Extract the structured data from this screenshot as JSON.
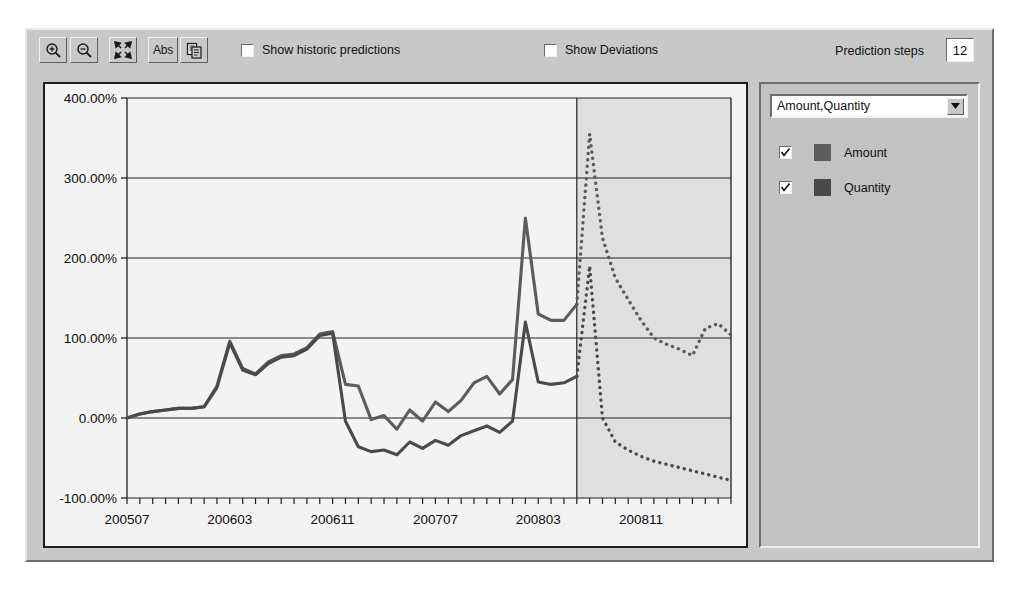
{
  "window": {
    "title": "Forecast Chart"
  },
  "toolbar": {
    "buttons": [
      {
        "name": "zoom-in-button",
        "icon": "zoom-in-icon",
        "label": ""
      },
      {
        "name": "zoom-out-button",
        "icon": "zoom-out-icon",
        "label": ""
      },
      {
        "name": "fit-to-window-button",
        "icon": "expand-arrows-icon",
        "label": ""
      },
      {
        "name": "absolute-values-button",
        "icon": "abs-text-icon",
        "label": "Abs"
      },
      {
        "name": "copy-to-clipboard-button",
        "icon": "copy-icon",
        "label": ""
      }
    ],
    "checkboxes": [
      {
        "name": "show-historic-predictions-checkbox",
        "label": "Show historic predictions",
        "checked": false
      },
      {
        "name": "show-deviations-checkbox",
        "label": "Show Deviations",
        "checked": false
      }
    ],
    "prediction_steps_label": "Prediction steps",
    "prediction_steps_value": "12"
  },
  "right_panel": {
    "dropdown_value": "Amount,Quantity",
    "dropdown_arrow": "chevron-down-icon",
    "legend": [
      {
        "label": "Amount",
        "checked": true,
        "color": "#5c5c5c"
      },
      {
        "label": "Quantity",
        "checked": true,
        "color": "#4a4a4a"
      }
    ]
  },
  "chart_data": {
    "type": "line",
    "title": "",
    "xlabel": "",
    "ylabel": "",
    "ylim": [
      -100,
      400
    ],
    "ytick_labels": [
      "400.00%",
      "300.00%",
      "200.00%",
      "100.00%",
      "0.00%",
      "-100.00%"
    ],
    "ytick_values": [
      400,
      300,
      200,
      100,
      0,
      -100
    ],
    "xtick_labels": [
      "200507",
      "200603",
      "200611",
      "200707",
      "200803",
      "200811"
    ],
    "xtick_values": [
      200507,
      200603,
      200611,
      200707,
      200803,
      200811
    ],
    "grid": true,
    "legend_position": "right-panel",
    "forecast_boundary_x": 200806,
    "forecast_shaded": true,
    "x": [
      200507,
      200508,
      200509,
      200510,
      200511,
      200512,
      200601,
      200602,
      200603,
      200604,
      200605,
      200606,
      200607,
      200608,
      200609,
      200610,
      200611,
      200612,
      200701,
      200702,
      200703,
      200704,
      200705,
      200706,
      200707,
      200708,
      200709,
      200710,
      200711,
      200712,
      200801,
      200802,
      200803,
      200804,
      200805,
      200806,
      200807,
      200808,
      200809,
      200810,
      200811,
      200812,
      200901,
      200902,
      200903,
      200904,
      200905,
      200906
    ],
    "series": [
      {
        "name": "Amount",
        "color": "#5c5c5c",
        "style": "solid-then-dotted",
        "dotted_from_index": 35,
        "values": [
          0,
          5,
          8,
          10,
          12,
          12,
          14,
          40,
          96,
          62,
          55,
          70,
          78,
          80,
          88,
          105,
          108,
          42,
          40,
          -2,
          3,
          -14,
          10,
          -4,
          20,
          8,
          22,
          44,
          52,
          30,
          48,
          250,
          130,
          122,
          122,
          142,
          355,
          225,
          175,
          148,
          122,
          100,
          92,
          86,
          78,
          112,
          118,
          104
        ]
      },
      {
        "name": "Quantity",
        "color": "#4a4a4a",
        "style": "solid-then-dotted",
        "dotted_from_index": 35,
        "values": [
          0,
          5,
          8,
          10,
          12,
          12,
          14,
          38,
          94,
          60,
          54,
          68,
          76,
          78,
          86,
          103,
          106,
          -4,
          -36,
          -42,
          -40,
          -46,
          -30,
          -38,
          -28,
          -34,
          -22,
          -16,
          -10,
          -18,
          -4,
          120,
          45,
          42,
          44,
          52,
          190,
          0,
          -30,
          -40,
          -48,
          -54,
          -58,
          -62,
          -66,
          -70,
          -74,
          -78
        ]
      }
    ]
  }
}
